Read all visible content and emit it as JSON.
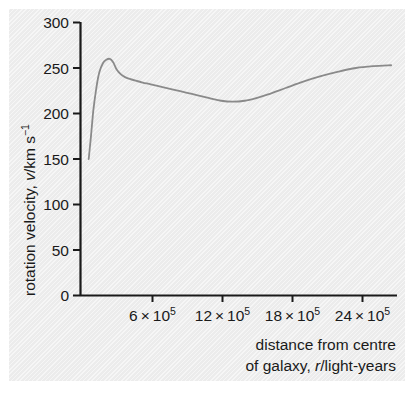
{
  "figure": {
    "background_color": "#ececec",
    "page_color": "#ffffff",
    "axis_color": "#1a1a1a",
    "curve_color": "#8a8a8a"
  },
  "chart_data": {
    "type": "line",
    "title": "",
    "subtitle": "",
    "xlabel_line1": "distance from centre",
    "xlabel_line2_pre": "of galaxy, ",
    "xlabel_line2_italic": "r",
    "xlabel_line2_post": "/light-years",
    "ylabel_pre": "rotation velocity, ",
    "ylabel_italic": "v",
    "ylabel_post": "/km s",
    "ylabel_sup": "−1",
    "xlim": [
      0,
      2700000
    ],
    "ylim": [
      0,
      300
    ],
    "grid": false,
    "legend": "none",
    "xticks": [
      600000,
      1200000,
      1800000,
      2400000
    ],
    "xticklabels": [
      {
        "mantissa": "6",
        "times": "×",
        "base": "10",
        "exponent": "5"
      },
      {
        "mantissa": "12",
        "times": "×",
        "base": "10",
        "exponent": "5"
      },
      {
        "mantissa": "18",
        "times": "×",
        "base": "10",
        "exponent": "5"
      },
      {
        "mantissa": "24",
        "times": "×",
        "base": "10",
        "exponent": "5"
      }
    ],
    "yticks": [
      0,
      50,
      100,
      150,
      200,
      250,
      300
    ],
    "yticklabels": [
      "0",
      "50",
      "100",
      "150",
      "200",
      "250",
      "300"
    ],
    "series": [
      {
        "name": "galactic rotation curve",
        "color": "#8a8a8a",
        "x": [
          70000,
          90000,
          110000,
          135000,
          160000,
          190000,
          220000,
          250000,
          280000,
          310000,
          345000,
          380000,
          420000,
          470000,
          530000,
          600000,
          700000,
          800000,
          900000,
          1000000,
          1100000,
          1200000,
          1300000,
          1400000,
          1500000,
          1600000,
          1750000,
          1900000,
          2050000,
          2200000,
          2350000,
          2500000,
          2650000
        ],
        "y": [
          150,
          176,
          204,
          228,
          245,
          255,
          259,
          260,
          256,
          248,
          243,
          240,
          238,
          236,
          234,
          232,
          229,
          226,
          223,
          220,
          217,
          214,
          213,
          214,
          217,
          221,
          228,
          235,
          241,
          246,
          250,
          252,
          253
        ]
      }
    ],
    "annotations": {
      "start_value": 150,
      "peak_value": 260,
      "peak_x": 250000,
      "min_value": 213,
      "min_x": 1250000,
      "end_value": 253
    }
  }
}
